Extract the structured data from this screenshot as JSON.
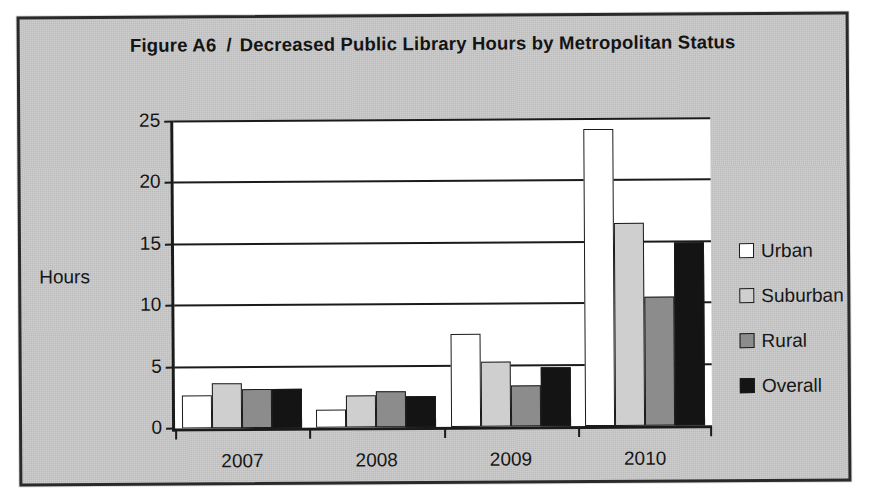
{
  "figure": {
    "number": "Figure A6",
    "separator": "/",
    "title": "Decreased Public Library Hours by Metropolitan Status"
  },
  "chart_data": {
    "type": "bar",
    "title": "Decreased Public Library Hours by Metropolitan Status",
    "xlabel": "",
    "ylabel": "Hours",
    "ylim": [
      0,
      25
    ],
    "yticks": [
      0,
      5,
      10,
      15,
      20,
      25
    ],
    "grid": true,
    "legend_position": "right",
    "categories": [
      "2007",
      "2008",
      "2009",
      "2010"
    ],
    "series": [
      {
        "name": "Urban",
        "color": "#ffffff",
        "values": [
          2.7,
          1.5,
          7.6,
          24.2
        ]
      },
      {
        "name": "Suburban",
        "color": "#cfcfcf",
        "values": [
          3.7,
          2.6,
          5.3,
          16.5
        ]
      },
      {
        "name": "Rural",
        "color": "#8c8c8c",
        "values": [
          3.2,
          2.9,
          3.3,
          10.5
        ]
      },
      {
        "name": "Overall",
        "color": "#141414",
        "values": [
          3.2,
          2.5,
          4.8,
          14.9
        ]
      }
    ]
  },
  "legend": {
    "items": [
      {
        "label": "Urban"
      },
      {
        "label": "Suburban"
      },
      {
        "label": "Rural"
      },
      {
        "label": "Overall"
      }
    ]
  }
}
